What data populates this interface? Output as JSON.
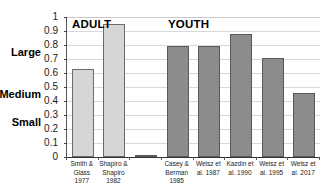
{
  "figure": {
    "cropped_title": "",
    "group_labels": [
      {
        "name": "adult",
        "text": "ADULT"
      },
      {
        "name": "youth",
        "text": "YOUTH"
      }
    ]
  },
  "chart_data": {
    "type": "bar",
    "title": "",
    "xlabel": "",
    "ylabel": "",
    "ylim": [
      0,
      1
    ],
    "yticks": [
      0,
      0.1,
      0.2,
      0.3,
      0.4,
      0.5,
      0.6,
      0.7,
      0.8,
      0.9,
      1
    ],
    "ytick_labels": [
      "0",
      "0.1",
      "0.2",
      "0.3",
      "0.4",
      "0.5",
      "0.6",
      "0.7",
      "0.8",
      "0.9",
      "1"
    ],
    "grid": true,
    "legend": "none",
    "anchor_labels": [
      {
        "text": "Large",
        "value": 0.75
      },
      {
        "text": "Medium",
        "value": 0.45
      },
      {
        "text": "Small",
        "value": 0.25
      }
    ],
    "categories": [
      "Smith & Glass 1977",
      "Shapiro & Shapiro 1982",
      "",
      "Casey & Berman 1985",
      "Weisz et al. 1987",
      "Kazdin et al. 1990",
      "Weisz et al. 1995",
      "Weisz et al. 2017"
    ],
    "values": [
      0.63,
      0.95,
      0.01,
      0.79,
      0.79,
      0.88,
      0.71,
      0.46
    ],
    "bars": [
      {
        "group": "adult",
        "value": 0.63,
        "color": "#d6d6d6",
        "label_lines": [
          "Smith &",
          "Glass",
          "1977"
        ]
      },
      {
        "group": "adult",
        "value": 0.95,
        "color": "#d6d6d6",
        "label_lines": [
          "Shapiro &",
          "Shapiro",
          "1982"
        ]
      },
      {
        "group": "gap",
        "value": 0.01,
        "color": "#8c8c8c",
        "label_lines": []
      },
      {
        "group": "youth",
        "value": 0.79,
        "color": "#8c8c8c",
        "label_lines": [
          "Casey &",
          "Berman",
          "1985"
        ]
      },
      {
        "group": "youth",
        "value": 0.79,
        "color": "#8c8c8c",
        "label_lines": [
          "Weisz et",
          "al. 1987"
        ]
      },
      {
        "group": "youth",
        "value": 0.88,
        "color": "#8c8c8c",
        "label_lines": [
          "Kazdin et",
          "al. 1990"
        ]
      },
      {
        "group": "youth",
        "value": 0.71,
        "color": "#8c8c8c",
        "label_lines": [
          "Weisz et",
          "al. 1995"
        ]
      },
      {
        "group": "youth",
        "value": 0.46,
        "color": "#8c8c8c",
        "label_lines": [
          "Weisz et",
          "al. 2017"
        ]
      }
    ],
    "colors": {
      "adult_bar": "#d6d6d6",
      "youth_bar": "#8c8c8c",
      "bar_outline": "#5a5a5a",
      "gridline": "#d9d9d9",
      "axis": "#333333",
      "text": "#1a1a1a"
    }
  }
}
